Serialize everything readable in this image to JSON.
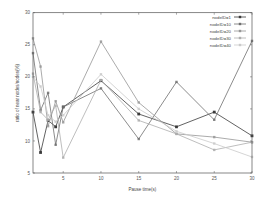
{
  "chart_data": {
    "type": "line",
    "title": "",
    "xlabel": "Pause time(s)",
    "ylabel": "ratio of near nodes/nodes(%)",
    "x": [
      1,
      2,
      3,
      4,
      5,
      10,
      15,
      20,
      25,
      30
    ],
    "xlim": [
      1,
      30
    ],
    "ylim": [
      5,
      30
    ],
    "xticks": [
      5,
      10,
      15,
      20,
      25,
      30
    ],
    "yticks": [
      5,
      10,
      15,
      20,
      25,
      30
    ],
    "grid": false,
    "legend_position": "top-right",
    "series": [
      {
        "name": "nodeID=1",
        "color": "#3a3a3a",
        "values": [
          14.5,
          8.2,
          13.2,
          12.2,
          15.3,
          19.4,
          14.2,
          12.2,
          14.5,
          10.8
        ]
      },
      {
        "name": "nodeID=10",
        "color": "#6e6e6e",
        "values": [
          23.7,
          14.8,
          17.5,
          9.4,
          15.3,
          18.2,
          10.3,
          19.2,
          13.3,
          25.6
        ]
      },
      {
        "name": "nodeID=20",
        "color": "#969696",
        "values": [
          26.0,
          21.6,
          12.3,
          16.2,
          12.9,
          25.5,
          16.0,
          11.1,
          10.6,
          9.8
        ]
      },
      {
        "name": "nodeID=30",
        "color": "#adadad",
        "values": [
          20.5,
          14.5,
          13.3,
          15.5,
          7.4,
          19.5,
          13.2,
          11.1,
          8.6,
          9.8
        ]
      },
      {
        "name": "nodeID=40",
        "color": "#cacaca",
        "values": [
          20.0,
          18.5,
          14.0,
          13.0,
          14.0,
          20.4,
          15.0,
          11.5,
          9.6,
          7.5
        ]
      }
    ]
  }
}
